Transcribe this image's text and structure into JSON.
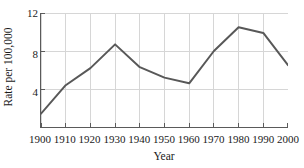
{
  "chart_data": {
    "type": "line",
    "title": "",
    "subtitle": "",
    "xlabel": "Year",
    "ylabel": "Rate per 100,000",
    "x": [
      1900,
      1910,
      1920,
      1930,
      1940,
      1950,
      1960,
      1970,
      1980,
      1990,
      2000
    ],
    "values": [
      1.4,
      4.4,
      6.2,
      8.7,
      6.3,
      5.2,
      4.6,
      8.0,
      10.5,
      9.9,
      6.5
    ],
    "series": [
      {
        "name": "Rate per 100,000",
        "values": [
          1.4,
          4.4,
          6.2,
          8.7,
          6.3,
          5.2,
          4.6,
          8.0,
          10.5,
          9.9,
          6.5
        ]
      }
    ],
    "xlim": [
      1900,
      2000
    ],
    "ylim": [
      0,
      12
    ],
    "x_tick_labels": [
      "1900",
      "1910",
      "1920",
      "1930",
      "1940",
      "1950",
      "1960",
      "1970",
      "1980",
      "1990",
      "2000"
    ],
    "y_tick_labels": [
      "4",
      "8",
      "12"
    ],
    "y_tick_values": [
      4,
      8,
      12
    ],
    "grid": "both",
    "legend": "none",
    "line_color": "#585858",
    "grid_color": "#d6d6d6",
    "axis_color": "#5a5a5a",
    "background_color": "#ffffff",
    "annotations": []
  }
}
